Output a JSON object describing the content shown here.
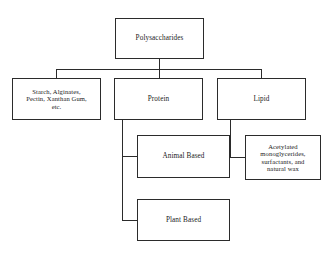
{
  "diagram": {
    "type": "hierarchy-tree",
    "orientation": "top-down",
    "background_color": "#ffffff",
    "line_color": "#2b2b2b",
    "box_border_color": "#2b2b2b",
    "text_color": "#1a1a1a",
    "root": {
      "id": "polysaccharides",
      "label": "Polysaccharides"
    },
    "level_two": [
      {
        "id": "starch",
        "label": "Starch, Alginates,\nPectin, Xanthan Gum,\netc."
      },
      {
        "id": "protein",
        "label": "Protein"
      },
      {
        "id": "lipid",
        "label": "Lipid"
      }
    ],
    "level_three": [
      {
        "id": "animal-based",
        "label": "Animal Based",
        "parent": "protein"
      },
      {
        "id": "plant-based",
        "label": "Plant Based",
        "parent": "protein"
      },
      {
        "id": "acetylated",
        "label": "Acetylated\nmonoglycerides,\nsurfactants, and\nnatural wax",
        "parent": "lipid"
      }
    ]
  }
}
